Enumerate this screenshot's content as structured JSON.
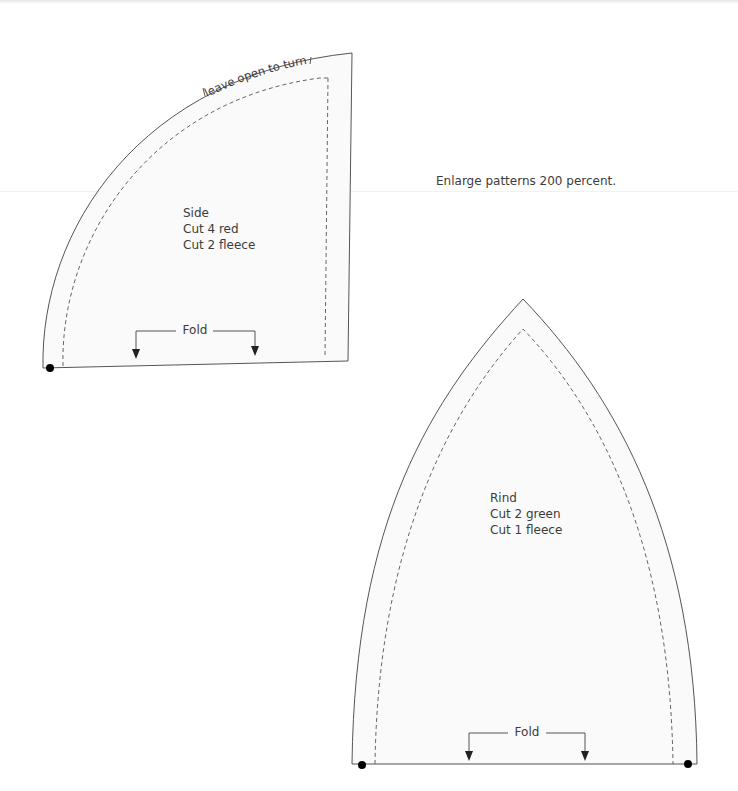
{
  "instructions": {
    "enlarge_note": "Enlarge patterns 200 percent."
  },
  "patterns": [
    {
      "id": "side",
      "name": "Side",
      "cut_lines": [
        "Cut 4 red",
        "Cut 2 fleece"
      ],
      "seam_note": "leave open to turn",
      "fold_label": "Fold"
    },
    {
      "id": "rind",
      "name": "Rind",
      "cut_lines": [
        "Cut 2 green",
        "Cut 1 fleece"
      ],
      "fold_label": "Fold"
    }
  ],
  "colors": {
    "background": "#ffffff",
    "piece_fill": "#fafafa",
    "outline": "#555555",
    "text": "#3c3c3c",
    "marker": "#000000"
  }
}
